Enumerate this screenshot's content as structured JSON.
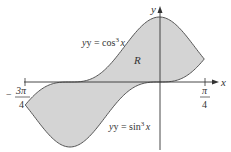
{
  "diagram": {
    "curves": [
      {
        "name": "upper",
        "equation_prefix": "y = cos",
        "exponent": "3",
        "variable": "x"
      },
      {
        "name": "lower",
        "equation_prefix": "y = sin",
        "exponent": "3",
        "variable": "x"
      }
    ],
    "region_label": "R",
    "axes": {
      "x_label": "x",
      "y_label": "y"
    },
    "ticks": {
      "left": {
        "numerator": "3π",
        "denominator": "4",
        "sign": "−"
      },
      "right": {
        "numerator": "π",
        "denominator": "4"
      }
    },
    "colors": {
      "fill": "#d4d4d4",
      "stroke": "#555555",
      "axis": "#333333"
    }
  }
}
